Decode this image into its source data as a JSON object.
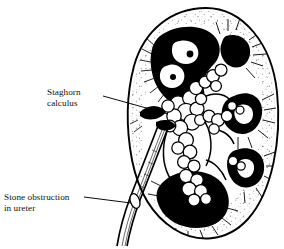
{
  "illustration": {
    "subject": "kidney-coronal-section",
    "style": "black-and-white line engraving",
    "ink_color": "#000000",
    "background_color": "#ffffff"
  },
  "labels": [
    {
      "id": "staghorn",
      "text": "Staghorn\ncalculus",
      "line1": "Staghorn",
      "line2": "calculus",
      "leader": "points right and downward to the branched stone mass filling the renal pelvis"
    },
    {
      "id": "ureter",
      "text": "Stone obstruction\nin ureter",
      "line1": "Stone obstruction",
      "line2": "in ureter",
      "leader": "points right and downward to the small stone lodged in the ureter"
    }
  ],
  "anatomy": {
    "capsule": "outer kidney capsule, double contour line",
    "cortex": "stippled outer zone",
    "pyramids": "radiating striations toward calyces",
    "calyces": "solid black calyceal spaces",
    "pelvis": "renal pelvis occupied by calculus",
    "ureter": "tube descending from hilum to lower left"
  }
}
